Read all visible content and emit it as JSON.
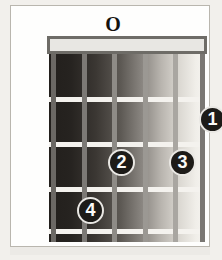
{
  "diagram": {
    "type": "guitar-chord-diagram",
    "open_string_markers": [
      {
        "label": "O",
        "string": 4,
        "name": "open-string-marker"
      }
    ],
    "finger_dots": [
      {
        "label": "1",
        "string": 5,
        "fret": 1,
        "name": "finger-dot-1-a"
      },
      {
        "label": "1",
        "string": 6,
        "fret": 1,
        "name": "finger-dot-1-b"
      },
      {
        "label": "2",
        "string": 2,
        "fret": 2,
        "name": "finger-dot-2"
      },
      {
        "label": "3",
        "string": 4,
        "fret": 2,
        "name": "finger-dot-3"
      },
      {
        "label": "4",
        "string": 1,
        "fret": 3,
        "name": "finger-dot-4"
      }
    ],
    "strings": 6,
    "frets": 5,
    "colors": {
      "board_dark": "#221f1c",
      "board_light": "#f6f4f0",
      "fret_wire": "#f4f2ee",
      "nut_fill": "#e8e7e3",
      "nut_border": "#6e6c67",
      "dot_fill": "#1d1b18",
      "dot_text": "#fbfaf8",
      "page_background": "#f2f0ec",
      "card_background": "#fefefd",
      "card_border": "#b9b6ae"
    }
  }
}
